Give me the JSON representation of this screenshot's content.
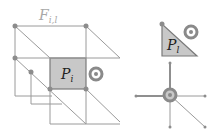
{
  "diagram": {
    "type": "mesh-connectivity",
    "left_panel": {
      "face_set_label": {
        "main": "F",
        "subscript": "i,l"
      },
      "highlighted_face_label": {
        "main": "P",
        "subscript": "i"
      },
      "orientation_marker": "counterclockwise-circle-icon"
    },
    "right_top_panel": {
      "triangle_label": {
        "main": "P",
        "subscript": "l"
      },
      "orientation_marker": "counterclockwise-circle-icon"
    },
    "right_bottom_panel": {
      "vertex_star": {
        "edge_count": 4,
        "center_marker": "counterclockwise-circle-icon"
      }
    },
    "colors": {
      "line": "#9a9a9a",
      "face_fill": "#c8c8c8",
      "vertex": "#8c8c8c",
      "marker": "#8a8a8a"
    }
  }
}
